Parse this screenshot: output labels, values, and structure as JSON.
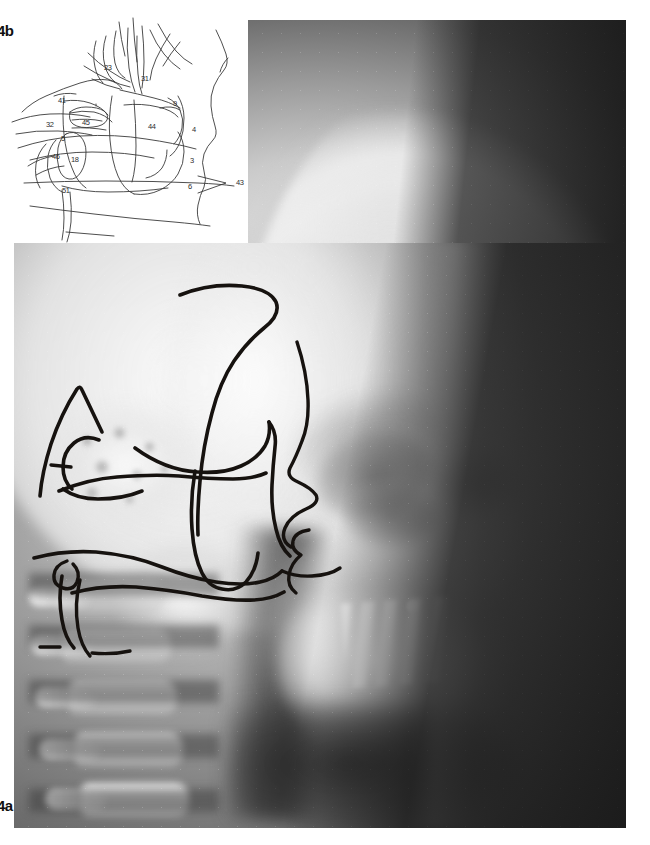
{
  "figure": {
    "radiograph_label": "4a",
    "diagram_label": "4b",
    "radiograph_caption_text": "4a",
    "diagram_caption_text": "4b"
  },
  "radiograph": {
    "name": "lateral-cephalometric-radiograph",
    "description": "Lateral cephalogram of the skull with hand-drawn black ink tracings over the midface, maxilla and cranial base",
    "ink_tracing_color": "#16120f"
  },
  "diagram": {
    "name": "cephalometric-line-tracing-diagram",
    "line_color": "#3a3a3a",
    "background_color": "#ffffff",
    "labels": [
      {
        "id": "label-23",
        "text": "23",
        "x": 104,
        "y": 63
      },
      {
        "id": "label-31",
        "text": "31",
        "x": 141,
        "y": 74
      },
      {
        "id": "label-41",
        "text": "41",
        "x": 58,
        "y": 96
      },
      {
        "id": "label-9",
        "text": "9",
        "x": 173,
        "y": 99
      },
      {
        "id": "label-32",
        "text": "32",
        "x": 46,
        "y": 120
      },
      {
        "id": "label-45",
        "text": "45",
        "x": 82,
        "y": 118
      },
      {
        "id": "label-44",
        "text": "44",
        "x": 148,
        "y": 122
      },
      {
        "id": "label-4",
        "text": "4",
        "x": 192,
        "y": 125
      },
      {
        "id": "label-5",
        "text": "5",
        "x": 61,
        "y": 134
      },
      {
        "id": "label-46",
        "text": "46",
        "x": 52,
        "y": 152
      },
      {
        "id": "label-18",
        "text": "18",
        "x": 71,
        "y": 155
      },
      {
        "id": "label-3",
        "text": "3",
        "x": 190,
        "y": 156
      },
      {
        "id": "label-6",
        "text": "6",
        "x": 188,
        "y": 182
      },
      {
        "id": "label-43",
        "text": "43",
        "x": 236,
        "y": 178
      },
      {
        "id": "label-51",
        "text": "51",
        "x": 62,
        "y": 186
      }
    ]
  }
}
